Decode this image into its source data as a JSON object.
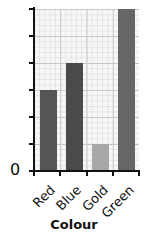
{
  "chart_data": {
    "type": "bar",
    "title": "",
    "xlabel": "Colour",
    "ylabel": "",
    "categories": [
      "Red",
      "Blue",
      "Gold",
      "Green"
    ],
    "values": [
      3,
      4,
      1,
      6
    ],
    "colors": [
      "#555555",
      "#4a4a4a",
      "#a8a8a8",
      "#666666"
    ],
    "ylim": [
      0,
      6
    ],
    "y_tick_count": 6,
    "y_tick_labels": [
      "0"
    ],
    "grid": true,
    "legend": null
  },
  "axis": {
    "x_title": "Colour",
    "y_zero_label": "0"
  }
}
